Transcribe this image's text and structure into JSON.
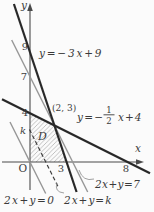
{
  "colors": {
    "background": "#fbfbfb",
    "axis": "#4a4a4a",
    "line_dark": "#282828",
    "line_gray": "#969696",
    "line_dashed": "#3d3d3d",
    "hatch": "#a8a8a8",
    "text": "#3a3a3a"
  },
  "axes": {
    "x_label": "x",
    "y_label": "y",
    "origin_label": "O"
  },
  "y_ticks": [
    {
      "label": "9"
    },
    {
      "label": "7"
    },
    {
      "label": "4"
    },
    {
      "label": "k"
    }
  ],
  "x_ticks": [
    {
      "label": "3"
    },
    {
      "label": "8"
    }
  ],
  "lines": [
    {
      "name": "steep",
      "equation_label": "y=−3x+9",
      "equation": "y = -3x + 9",
      "style": "solid-dark"
    },
    {
      "name": "shallow",
      "equation_label_prefix": "y=−",
      "fraction_numerator": "1",
      "fraction_denominator": "2",
      "equation_label_suffix": "x+4",
      "equation": "y = -(1/2)x + 4",
      "style": "solid-dark"
    },
    {
      "name": "level7",
      "equation_label": "2x+y=7",
      "equation": "2x + y = 7",
      "style": "solid-gray"
    },
    {
      "name": "level0",
      "equation_label": "2x+y=0",
      "equation": "2x + y = 0",
      "style": "solid-gray"
    },
    {
      "name": "levelk",
      "equation_label": "2x+y=k",
      "equation": "2x + y = k",
      "style": "dashed"
    }
  ],
  "point": {
    "label": "(2, 3)",
    "x": 2,
    "y": 3
  },
  "region": {
    "label": "D",
    "vertices": [
      [
        0,
        0
      ],
      [
        0,
        4
      ],
      [
        2,
        3
      ],
      [
        3,
        0
      ]
    ]
  }
}
